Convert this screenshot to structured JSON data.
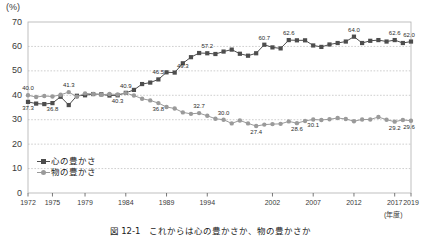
{
  "chart_data": {
    "type": "line",
    "title": "図 12-1　これからは心の豊かさか、物の豊かさか",
    "xlabel": "(年度)",
    "ylabel": "(%)",
    "ylim": [
      0,
      70
    ],
    "ytick_step": 10,
    "yticks": [
      "0",
      "10",
      "20",
      "30",
      "40",
      "50",
      "60",
      "70"
    ],
    "xticks": [
      "1972",
      "1975",
      "1979",
      "1984",
      "1989",
      "1994",
      "2002",
      "2007",
      "2012",
      "2017",
      "2019"
    ],
    "xtick_years": [
      1972,
      1975,
      1979,
      1984,
      1989,
      1994,
      2002,
      2007,
      2012,
      2017,
      2019
    ],
    "x": [
      1972,
      1973,
      1974,
      1975,
      1976,
      1977,
      1978,
      1979,
      1980,
      1981,
      1982,
      1983,
      1984,
      1985,
      1986,
      1987,
      1988,
      1989,
      1990,
      1991,
      1992,
      1993,
      1994,
      1995,
      1996,
      1997,
      1998,
      1999,
      2000,
      2001,
      2002,
      2003,
      2004,
      2005,
      2006,
      2007,
      2008,
      2009,
      2010,
      2011,
      2012,
      2013,
      2014,
      2015,
      2016,
      2017,
      2018,
      2019
    ],
    "grid": "horizontal-dotted",
    "legend_position": "inside-bottom-left",
    "series": [
      {
        "name": "心の豊かさ",
        "marker": "square",
        "color": "#4d4d4d",
        "values": [
          37.3,
          36.6,
          36.4,
          36.8,
          39.4,
          36.0,
          39.8,
          40.0,
          40.5,
          40.4,
          39.9,
          40.0,
          41.0,
          42.2,
          44.6,
          45.2,
          46.5,
          49.4,
          49.3,
          53.1,
          55.6,
          57.3,
          57.2,
          56.9,
          57.9,
          58.7,
          57.0,
          56.2,
          57.2,
          60.7,
          59.6,
          59.2,
          62.6,
          62.5,
          62.5,
          60.4,
          59.8,
          60.8,
          61.4,
          62.0,
          64.0,
          61.4,
          62.3,
          62.6,
          62.0,
          62.6,
          61.4,
          62.0
        ],
        "labels": [
          {
            "year": 1972,
            "value": 37.3
          },
          {
            "year": 1975,
            "value": 36.8
          },
          {
            "year": 1988,
            "value": 46.5
          },
          {
            "year": 1991,
            "value": 49.3
          },
          {
            "year": 1994,
            "value": 57.2
          },
          {
            "year": 2001,
            "value": 60.7
          },
          {
            "year": 2004,
            "value": 62.6
          },
          {
            "year": 2012,
            "value": 64.0
          },
          {
            "year": 2017,
            "value": 62.6
          },
          {
            "year": 2019,
            "value": 62.0
          }
        ]
      },
      {
        "name": "物の豊かさ",
        "marker": "circle",
        "color": "#9a9a9a",
        "values": [
          40.0,
          39.3,
          39.7,
          39.5,
          40.2,
          41.3,
          39.4,
          40.8,
          40.5,
          40.2,
          40.5,
          40.3,
          40.9,
          39.9,
          38.6,
          37.9,
          36.8,
          35.2,
          34.6,
          33.0,
          32.4,
          32.7,
          31.6,
          30.4,
          30.0,
          28.5,
          29.7,
          28.5,
          27.4,
          28.0,
          28.2,
          28.3,
          29.3,
          28.6,
          29.5,
          30.1,
          29.9,
          30.2,
          30.7,
          30.3,
          29.4,
          30.1,
          30.1,
          31.1,
          30.0,
          29.2,
          29.9,
          29.6
        ],
        "labels": [
          {
            "year": 1972,
            "value": 40.0
          },
          {
            "year": 1977,
            "value": 41.3
          },
          {
            "year": 1983,
            "value": 40.3
          },
          {
            "year": 1984,
            "value": 40.9
          },
          {
            "year": 1988,
            "value": 36.8
          },
          {
            "year": 1993,
            "value": 32.7
          },
          {
            "year": 1996,
            "value": 30.0
          },
          {
            "year": 2000,
            "value": 27.4
          },
          {
            "year": 2005,
            "value": 28.6
          },
          {
            "year": 2007,
            "value": 30.1
          },
          {
            "year": 2017,
            "value": 29.2
          },
          {
            "year": 2019,
            "value": 29.6
          }
        ]
      }
    ]
  },
  "axes": {
    "unit_y": "(%)",
    "unit_x": "(年度)"
  },
  "legend": {
    "items": [
      {
        "label": "心の豊かさ",
        "marker": "square-line-icon"
      },
      {
        "label": "物の豊かさ",
        "marker": "circle-line-icon"
      }
    ]
  },
  "caption": {
    "text": "図 12-1　これからは心の豊かさか、物の豊かさか"
  }
}
